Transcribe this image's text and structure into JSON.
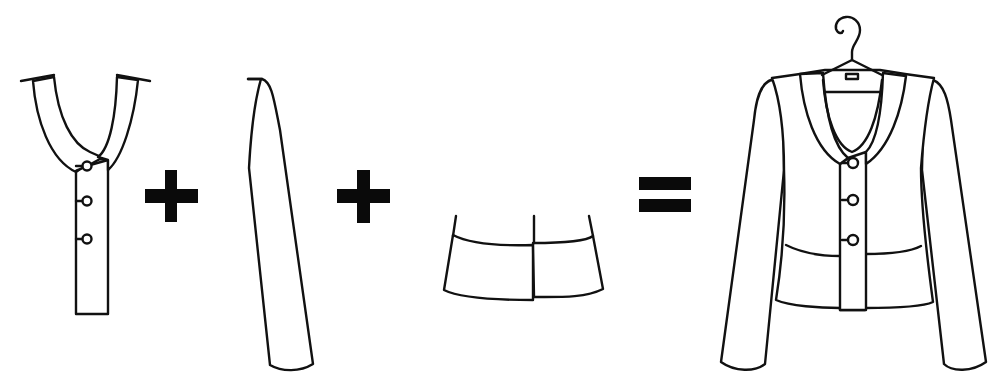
{
  "diagram": {
    "description": "Garment construction equation: collar-placket piece + sleeve + peplum = finished jacket on hanger",
    "colors": {
      "stroke": "#111111",
      "fill": "#ffffff",
      "operator": "#0a0a0a",
      "background": "#ffffff"
    },
    "parts": [
      {
        "id": "collar-placket",
        "label": "Collar and button placket",
        "buttons": 3
      },
      {
        "id": "sleeve",
        "label": "Sleeve"
      },
      {
        "id": "peplum",
        "label": "Peplum / waistband"
      },
      {
        "id": "jacket",
        "label": "Finished jacket on hanger",
        "buttons": 3
      }
    ],
    "operators": [
      {
        "id": "plus-1",
        "symbol": "+"
      },
      {
        "id": "plus-2",
        "symbol": "+"
      },
      {
        "id": "equals",
        "symbol": "="
      }
    ]
  }
}
